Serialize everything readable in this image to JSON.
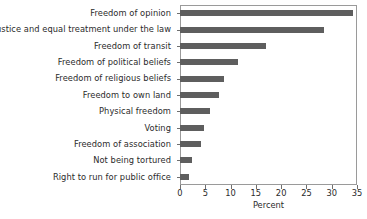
{
  "chart_data": {
    "type": "bar",
    "orientation": "horizontal",
    "title": "",
    "xlabel": "Percent",
    "ylabel": "",
    "xlim": [
      0,
      35
    ],
    "xticks": [
      0,
      5,
      10,
      15,
      20,
      25,
      30,
      35
    ],
    "xtick_labels": [
      "0",
      "5",
      "10",
      "15",
      "20",
      "25",
      "30",
      "35"
    ],
    "grid": false,
    "legend": null,
    "bar_color": "#5e5e5e",
    "frame_color": "#9a9a9a",
    "categories": [
      "Freedom of opinion",
      "Justice and equal treatment under the law",
      "Freedom of transit",
      "Freedom of political beliefs",
      "Freedom of religious beliefs",
      "Freedom to own land",
      "Physical freedom",
      "Voting",
      "Freedom of association",
      "Not being tortured",
      "Right to run for public office"
    ],
    "values": [
      34.2,
      28.5,
      17.0,
      11.5,
      8.7,
      7.7,
      5.9,
      4.7,
      4.2,
      2.4,
      1.8
    ]
  }
}
